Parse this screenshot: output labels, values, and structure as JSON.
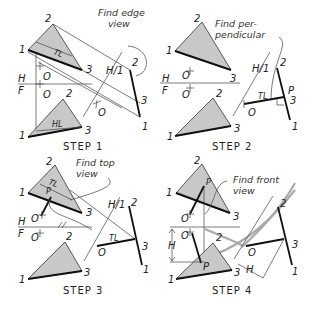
{
  "figure": {
    "panels": [
      {
        "id": "step1",
        "caption": "STEP 1",
        "note": [
          "Find edge",
          "view"
        ],
        "labels": {
          "top_v1": "1",
          "top_v2": "2",
          "top_v3": "3",
          "top_true_length": "TL",
          "point_o_top": "O",
          "fold_h": "H",
          "fold_f": "F",
          "point_o_front": "O",
          "front_v1": "1",
          "front_v2": "2",
          "front_v3": "3",
          "front_horizontal_line": "HL",
          "aux_fold": "H/1",
          "aux_v1": "1",
          "aux_v2": "2",
          "aux_v3": "3",
          "aux_o": "O"
        }
      },
      {
        "id": "step2",
        "caption": "STEP 2",
        "note": [
          "Find per-",
          "pendicular"
        ],
        "labels": {
          "top_v1": "1",
          "top_v2": "2",
          "top_v3": "3",
          "point_o_top": "O",
          "fold_h": "H",
          "fold_f": "F",
          "point_o_front": "O",
          "front_v1": "1",
          "front_v2": "2",
          "front_v3": "3",
          "aux_fold": "H/1",
          "aux_v1": "1",
          "aux_v2": "2",
          "aux_v3": "3",
          "aux_o": "O",
          "aux_tl": "TL",
          "aux_p": "P"
        }
      },
      {
        "id": "step3",
        "caption": "STEP 3",
        "note": [
          "Find top",
          "view"
        ],
        "labels": {
          "top_v1": "1",
          "top_v2": "2",
          "top_v3": "3",
          "top_tl": "TL",
          "top_p": "P",
          "point_o_top": "O",
          "fold_h": "H",
          "fold_f": "F",
          "point_o_front": "O",
          "front_v1": "1",
          "front_v2": "2",
          "front_v3": "3",
          "aux_fold": "H/1",
          "aux_v1": "1",
          "aux_v2": "2",
          "aux_v3": "3",
          "aux_o": "O",
          "aux_tl": "TL"
        }
      },
      {
        "id": "step4",
        "caption": "STEP 4",
        "note": [
          "Find front",
          "view"
        ],
        "labels": {
          "top_v1": "1",
          "top_v2": "2",
          "top_v3": "3",
          "top_p": "P",
          "point_o_top": "O",
          "point_o_front": "O",
          "front_v1": "1",
          "front_v2": "2",
          "front_v3": "3",
          "front_p": "P",
          "dim_h_left": "H",
          "dim_h_aux": "H",
          "aux_v1": "1",
          "aux_v2": "2",
          "aux_v3": "3",
          "aux_o": "O"
        }
      }
    ],
    "colors": {
      "plane_fill": "#c8c8c8",
      "line": "#111111",
      "construction": "#aaaaaa"
    }
  }
}
